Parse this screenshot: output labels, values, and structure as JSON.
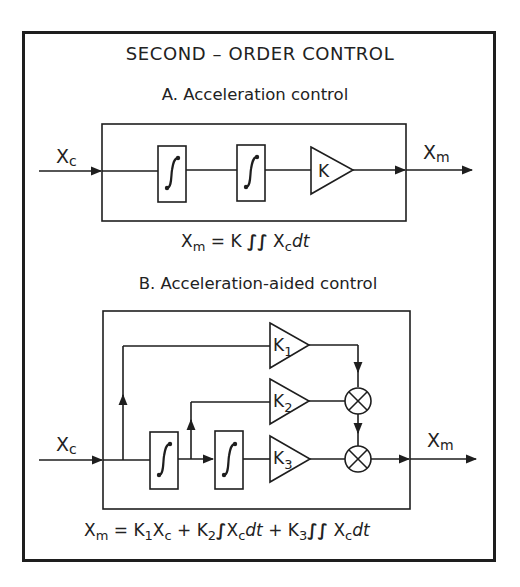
{
  "title": "SECOND – ORDER CONTROL",
  "section_a": {
    "heading": "A. Acceleration control",
    "input_label": "X",
    "input_sub": "c",
    "output_label": "X",
    "output_sub": "m",
    "blocks": [
      {
        "type": "integrator",
        "symbol": "∫"
      },
      {
        "type": "integrator",
        "symbol": "∫"
      },
      {
        "type": "gain",
        "label": "K"
      }
    ],
    "equation": {
      "lhs": "X",
      "lhs_sub": "m",
      "rhs": "= K ",
      "integral": "∫∫",
      "var": " X",
      "var_sub": "c",
      "dt": "dt"
    }
  },
  "section_b": {
    "heading": "B. Acceleration-aided control",
    "input_label": "X",
    "input_sub": "c",
    "output_label": "X",
    "output_sub": "m",
    "gains": [
      {
        "label": "K",
        "sub": "1"
      },
      {
        "label": "K",
        "sub": "2"
      },
      {
        "label": "K",
        "sub": "3"
      }
    ],
    "integrators": [
      {
        "type": "integrator",
        "symbol": "∫"
      },
      {
        "type": "integrator",
        "symbol": "∫"
      }
    ],
    "multipliers": 2,
    "equation": {
      "lhs": "X",
      "lhs_sub": "m",
      "t1": "= K",
      "t1_sub": "1",
      "t1_var": "X",
      "t1_var_sub": "c",
      "t2": " + K",
      "t2_sub": "2",
      "t2_int": "∫",
      "t2_var": "X",
      "t2_var_sub": "c",
      "t2_dt": "dt",
      "t3": " + K",
      "t3_sub": "3",
      "t3_int": "∫∫",
      "t3_var": " X",
      "t3_var_sub": "c",
      "t3_dt": "dt"
    }
  }
}
